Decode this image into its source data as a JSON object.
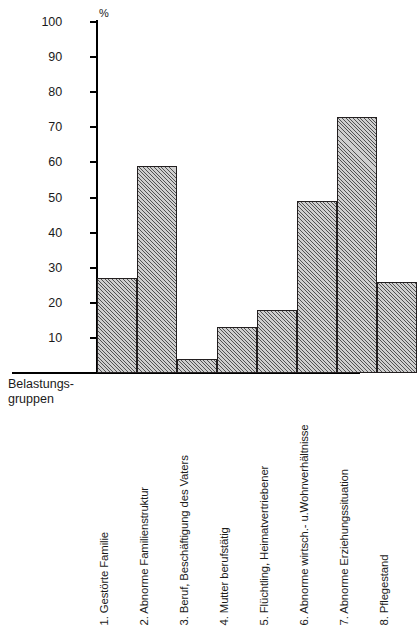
{
  "chart_data": {
    "type": "bar",
    "title": "",
    "subtitle": "",
    "xlabel": "Belastungs-gruppen",
    "ylabel": "%",
    "ylim": [
      0,
      100
    ],
    "grid": false,
    "legend": "none",
    "orientation": "vertical",
    "categories": [
      "1. Gestörte Familie",
      "2. Abnorme Familienstruktur",
      "3. Beruf, Beschäftigung des Vaters",
      "4. Mutter berufstätig",
      "5. Flüchtling, Heimatvertriebener",
      "6. Abnorme wirtsch.- u.Wohnverhältnisse",
      "7. Abnorme Erziehungssituation",
      "8. Pflegestand"
    ],
    "values": [
      27,
      59,
      4,
      13,
      18,
      49,
      73,
      26
    ],
    "ytick_labels": [
      "10",
      "20",
      "30",
      "40",
      "50",
      "60",
      "70",
      "80",
      "90",
      "100"
    ],
    "ytick_values": [
      10,
      20,
      30,
      40,
      50,
      60,
      70,
      80,
      90,
      100
    ],
    "unit_symbol": "%",
    "bar_fill_color": "#cfcfcf",
    "bar_edge_color": "#231f20",
    "axis_color": "#000000"
  },
  "axis": {
    "y_unit": "%",
    "x_caption_line1": "Belastungs-",
    "x_caption_line2": "gruppen"
  }
}
